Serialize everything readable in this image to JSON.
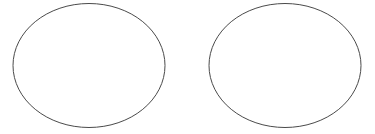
{
  "canvas": {
    "width": 375,
    "height": 134,
    "background_color": "#ffffff",
    "title": "Two Ellipses"
  },
  "figure": {
    "shape_count": 2,
    "shape_type": "ellipse",
    "stroke_color": "#4a4a4a",
    "stroke_width": 1,
    "fill_color": "none",
    "shapes": [
      {
        "name": "left-ellipse",
        "cx": 89,
        "cy": 65.5,
        "rx": 76,
        "ry": 62,
        "stroke_color": "#4a4a4a",
        "stroke_width": 1,
        "fill_color": "none"
      },
      {
        "name": "right-ellipse",
        "cx": 285,
        "cy": 65.5,
        "rx": 76,
        "ry": 62,
        "stroke_color": "#4a4a4a",
        "stroke_width": 1,
        "fill_color": "none"
      }
    ]
  }
}
